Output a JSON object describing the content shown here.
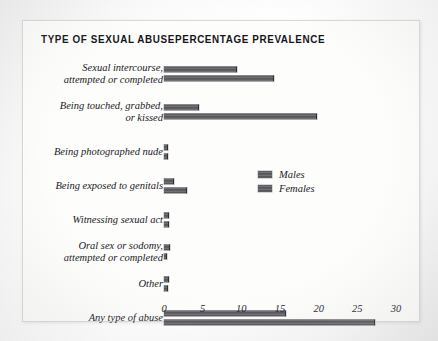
{
  "headers": {
    "category_header": "TYPE OF SEXUAL ABUSE",
    "value_header": "PERCENTAGE PREVALENCE"
  },
  "legend": {
    "males_label": "Males",
    "females_label": "Females",
    "position": "inside-right"
  },
  "colors": {
    "bar_fill": "#5e5e63",
    "bar_edge": "#2e2e33",
    "text": "#1a1a1f",
    "panel_background": "#fdfdfc",
    "page_background": "#f4f4f4"
  },
  "chart_data": {
    "type": "bar",
    "orientation": "horizontal",
    "title": "PERCENTAGE PREVALENCE",
    "xlabel": "",
    "ylabel": "TYPE OF SEXUAL ABUSE",
    "xlim": [
      0,
      30
    ],
    "grid": false,
    "xticks": [
      0,
      5,
      10,
      15,
      20,
      25,
      30
    ],
    "xticklabels": [
      "0",
      "5",
      "10",
      "15",
      "20",
      "25",
      "30"
    ],
    "categories": [
      "Sexual intercourse,\nattempted or completed",
      "Being touched, grabbed,\nor kissed",
      "Being photographed nude",
      "Being exposed to genitals",
      "Witnessing sexual act",
      "Oral sex or sodomy,\nattempted or completed",
      "Other",
      "Any type of abuse"
    ],
    "series": [
      {
        "name": "Males",
        "values": [
          9.5,
          4.5,
          0.5,
          1.3,
          0.7,
          0.8,
          0.7,
          15.8
        ]
      },
      {
        "name": "Females",
        "values": [
          14.2,
          19.8,
          0.5,
          3.0,
          0.6,
          0.4,
          0.5,
          27.3
        ]
      }
    ]
  }
}
